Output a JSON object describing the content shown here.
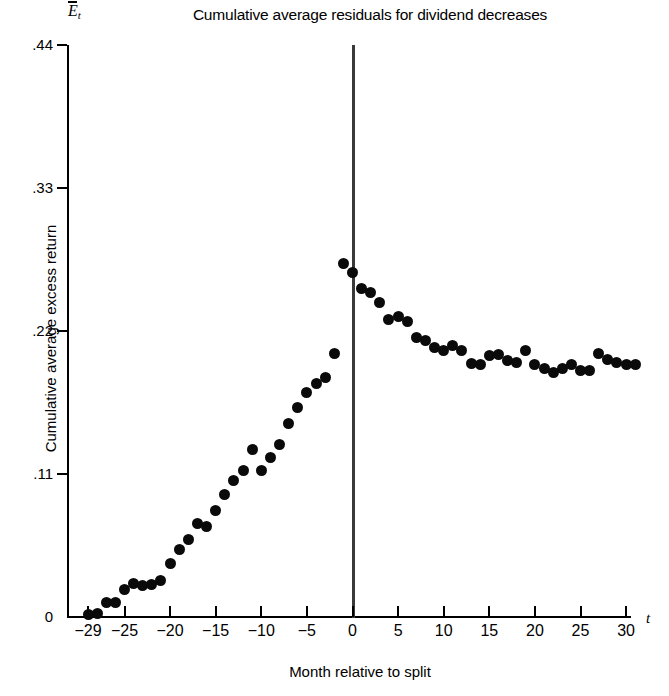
{
  "chart_data": {
    "type": "scatter",
    "title": "Cumulative average residuals for dividend decreases",
    "xlabel": "Month relative to split",
    "ylabel": "Cumulative average excess return",
    "y_symbol": "E",
    "y_symbol_sub": "t",
    "x_symbol": "t",
    "xlim": [
      -30,
      32
    ],
    "ylim": [
      0,
      0.44
    ],
    "grid": false,
    "legend": null,
    "xticks": [
      -29,
      -25,
      -20,
      -15,
      -10,
      -5,
      0,
      5,
      10,
      15,
      20,
      25,
      30
    ],
    "xtick_labels": [
      "−29",
      "−25",
      "−20",
      "−15",
      "−10",
      "−5",
      "0",
      "5",
      "10",
      "15",
      "20",
      "25",
      "30"
    ],
    "yticks": [
      0,
      0.11,
      0.22,
      0.33,
      0.44
    ],
    "ytick_labels": [
      "0",
      ".11",
      ".22",
      ".33",
      ".44"
    ],
    "event_line_x": 0,
    "marker_color": "#0a0a0a",
    "x": [
      -29,
      -28,
      -27,
      -26,
      -25,
      -24,
      -23,
      -22,
      -21,
      -20,
      -19,
      -18,
      -17,
      -16,
      -15,
      -14,
      -13,
      -12,
      -11,
      -10,
      -9,
      -8,
      -7,
      -6,
      -5,
      -4,
      -3,
      -2,
      -1,
      0,
      1,
      2,
      3,
      4,
      5,
      6,
      7,
      8,
      9,
      10,
      11,
      12,
      13,
      14,
      15,
      16,
      17,
      18,
      19,
      20,
      21,
      22,
      23,
      24,
      25,
      26,
      27,
      28,
      29,
      30,
      31
    ],
    "y": [
      0.002,
      0.003,
      0.011,
      0.011,
      0.021,
      0.026,
      0.024,
      0.025,
      0.028,
      0.041,
      0.052,
      0.06,
      0.072,
      0.07,
      0.082,
      0.094,
      0.105,
      0.113,
      0.129,
      0.113,
      0.123,
      0.133,
      0.149,
      0.161,
      0.173,
      0.18,
      0.184,
      0.203,
      0.272,
      0.265,
      0.253,
      0.25,
      0.242,
      0.229,
      0.231,
      0.227,
      0.215,
      0.213,
      0.207,
      0.205,
      0.209,
      0.205,
      0.195,
      0.194,
      0.201,
      0.202,
      0.197,
      0.196,
      0.205,
      0.194,
      0.191,
      0.188,
      0.191,
      0.194,
      0.19,
      0.19,
      0.203,
      0.198,
      0.196,
      0.194,
      0.194
    ]
  }
}
